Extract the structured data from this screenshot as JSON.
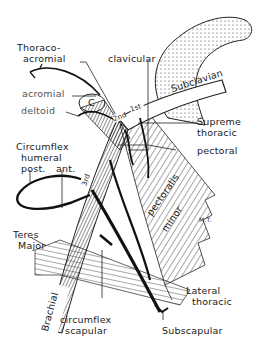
{
  "diagram": {
    "colors": {
      "ink": "#1a1a1a",
      "background": "#ffffff",
      "muted_label": "#555555"
    },
    "labels": {
      "thoraco_acromial_1": "Thoraco-",
      "thoraco_acromial_2": "acromial",
      "clavicular": "clavicular",
      "subclavian": "Subclavian",
      "acromial": "acromial",
      "deltoid": "deltoid",
      "supreme_thoracic_1": "Supreme",
      "supreme_thoracic_2": "thoracic",
      "pectoral": "pectoral",
      "circumflex_humeral_1": "Circumflex",
      "circumflex_humeral_2": "humeral",
      "post": "post.",
      "ant": "ant.",
      "pectoralis": "pectoralis",
      "minor": "minor",
      "initials": "M.T.",
      "teres_major_1": "Teres",
      "teres_major_2": "Major",
      "brachial": "Brachial",
      "circumflex_scapular_1": "circumflex",
      "circumflex_scapular_2": "scapular",
      "lateral_thoracic_1": "Lateral",
      "lateral_thoracic_2": "thoracic",
      "subscapular": "Subscapular",
      "part_1st": "1st",
      "part_2nd": "2nd",
      "part_3rd": "3rd",
      "coracoid": "C"
    }
  }
}
